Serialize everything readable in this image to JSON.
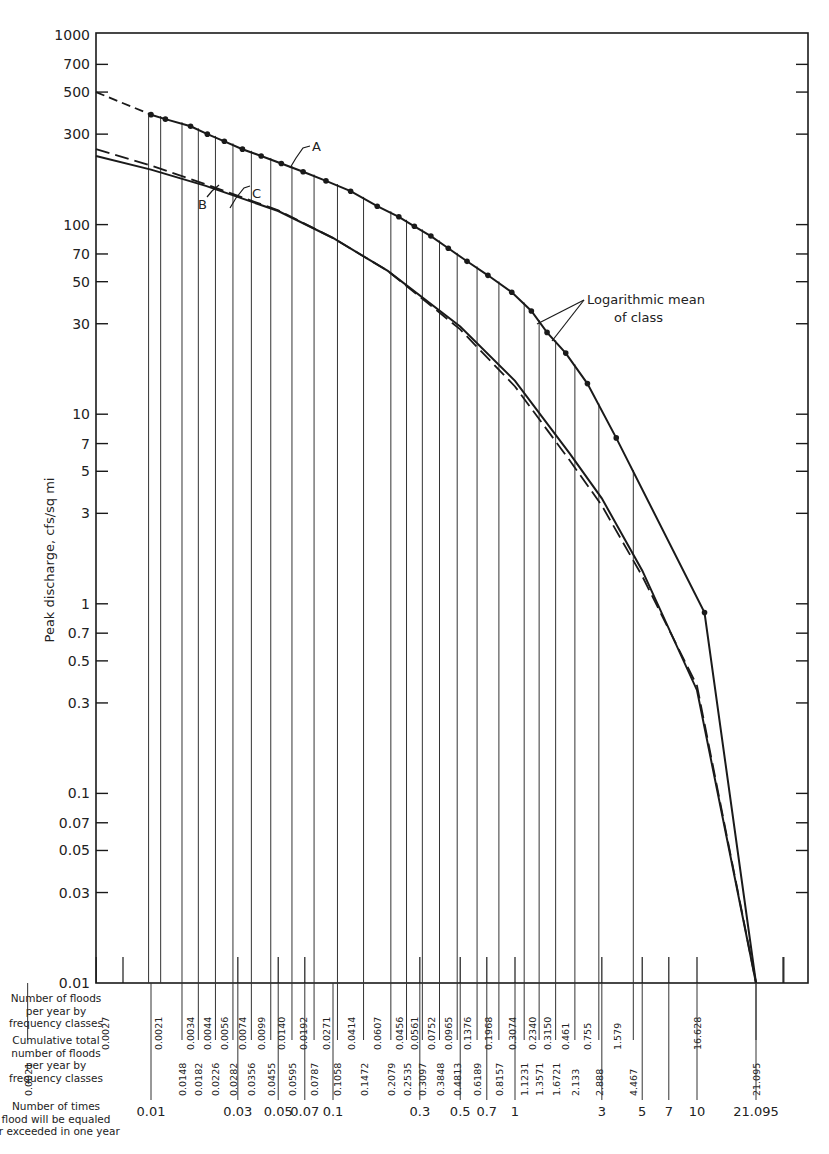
{
  "chart_data": {
    "type": "line",
    "title": "",
    "xlabel": "Number of times flood will be equaled or exceeded in one year",
    "ylabel": "Peak discharge, cfs/sq mi",
    "xscale": "log",
    "yscale": "log",
    "xlim": [
      0.01,
      40
    ],
    "ylim": [
      0.01,
      1000
    ],
    "grid": false,
    "y_ticks": [
      {
        "v": 1000,
        "label": "1000"
      },
      {
        "v": 700,
        "label": "700"
      },
      {
        "v": 500,
        "label": "500"
      },
      {
        "v": 300,
        "label": "300"
      },
      {
        "v": 100,
        "label": "100"
      },
      {
        "v": 70,
        "label": "70"
      },
      {
        "v": 50,
        "label": "50"
      },
      {
        "v": 30,
        "label": "30"
      },
      {
        "v": 10,
        "label": "10"
      },
      {
        "v": 7,
        "label": "7"
      },
      {
        "v": 5,
        "label": "5"
      },
      {
        "v": 3,
        "label": "3"
      },
      {
        "v": 1,
        "label": "1"
      },
      {
        "v": 0.7,
        "label": "0.7"
      },
      {
        "v": 0.5,
        "label": "0.5"
      },
      {
        "v": 0.3,
        "label": "0.3"
      },
      {
        "v": 0.1,
        "label": "0.1"
      },
      {
        "v": 0.07,
        "label": "0.07"
      },
      {
        "v": 0.05,
        "label": "0.05"
      },
      {
        "v": 0.03,
        "label": "0.03"
      },
      {
        "v": 0.01,
        "label": "0.01"
      }
    ],
    "x_ticks": [
      {
        "v": 0.01,
        "label": "0.01"
      },
      {
        "v": 0.03,
        "label": "0.03"
      },
      {
        "v": 0.05,
        "label": "0.05"
      },
      {
        "v": 0.07,
        "label": "0.07"
      },
      {
        "v": 0.1,
        "label": "0.1"
      },
      {
        "v": 0.3,
        "label": "0.3"
      },
      {
        "v": 0.5,
        "label": "0.5"
      },
      {
        "v": 0.7,
        "label": "0.7"
      },
      {
        "v": 1,
        "label": "1"
      },
      {
        "v": 3,
        "label": "3"
      },
      {
        "v": 5,
        "label": "5"
      },
      {
        "v": 7,
        "label": "7"
      },
      {
        "v": 10,
        "label": "10"
      },
      {
        "v": 21.095,
        "label": "21.095"
      }
    ],
    "bottom_axis_minor_ticks": [
      0.005,
      0.02,
      0.04,
      0.06,
      0.2,
      0.4,
      0.6,
      2,
      4,
      6,
      8,
      30
    ],
    "row_labels": {
      "floods_per_class": "Number of floods per year by frequency classes",
      "cumulative": "Cumulative total number of floods per year by frequency classes",
      "times_exceeded": "Number of times flood will be equaled or exceeded in one year"
    },
    "frequency_classes": [
      {
        "n": "0.0021",
        "cum": "0.0021"
      },
      {
        "n": "0.0027",
        "cum": "0.0148"
      },
      {
        "n": "0.0034",
        "cum": "0.0182"
      },
      {
        "n": "0.0044",
        "cum": "0.0226"
      },
      {
        "n": "0.0056",
        "cum": "0.0282"
      },
      {
        "n": "0.0074",
        "cum": "0.0356"
      },
      {
        "n": "0.0099",
        "cum": "0.0455"
      },
      {
        "n": "0.0140",
        "cum": "0.0595"
      },
      {
        "n": "0.0192",
        "cum": "0.0787"
      },
      {
        "n": "0.0271",
        "cum": "0.1058"
      },
      {
        "n": "0.0414",
        "cum": "0.1472"
      },
      {
        "n": "0.0607",
        "cum": "0.2079"
      },
      {
        "n": "0.0456",
        "cum": "0.2535"
      },
      {
        "n": "0.0561",
        "cum": "0.3097"
      },
      {
        "n": "0.0752",
        "cum": "0.3848"
      },
      {
        "n": "0.0965",
        "cum": "0.4813"
      },
      {
        "n": "0.1376",
        "cum": "0.6189"
      },
      {
        "n": "0.1968",
        "cum": "0.8157"
      },
      {
        "n": "0.3074",
        "cum": "1.1231"
      },
      {
        "n": "0.2340",
        "cum": "1.3571"
      },
      {
        "n": "0.3150",
        "cum": "1.6721"
      },
      {
        "n": "0.461",
        "cum": "2.133"
      },
      {
        "n": "0.755",
        "cum": "2.888"
      },
      {
        "n": "1.579",
        "cum": "4.467"
      },
      {
        "n": "16.628",
        "cum": "21.095"
      }
    ],
    "class_boundaries_x": [
      0.0021,
      0.0048,
      0.0148,
      0.0182,
      0.0226,
      0.0282,
      0.0356,
      0.0455,
      0.0595,
      0.0787,
      0.1058,
      0.1472,
      0.2079,
      0.2535,
      0.3097,
      0.3848,
      0.4813,
      0.6189,
      0.8157,
      1.1231,
      1.3571,
      1.6721,
      2.133,
      2.888,
      4.467,
      21.095
    ],
    "series": [
      {
        "name": "A",
        "style": "solid with points (dashed extrapolation to left axis)",
        "points": [
          {
            "x": 0.01,
            "y": 380
          },
          {
            "x": 0.012,
            "y": 360
          },
          {
            "x": 0.0165,
            "y": 330
          },
          {
            "x": 0.0204,
            "y": 300
          },
          {
            "x": 0.0253,
            "y": 275
          },
          {
            "x": 0.0318,
            "y": 250
          },
          {
            "x": 0.0403,
            "y": 230
          },
          {
            "x": 0.052,
            "y": 210
          },
          {
            "x": 0.0685,
            "y": 190
          },
          {
            "x": 0.0915,
            "y": 170
          },
          {
            "x": 0.125,
            "y": 150
          },
          {
            "x": 0.175,
            "y": 125
          },
          {
            "x": 0.23,
            "y": 110
          },
          {
            "x": 0.28,
            "y": 98
          },
          {
            "x": 0.345,
            "y": 87
          },
          {
            "x": 0.43,
            "y": 75
          },
          {
            "x": 0.545,
            "y": 64
          },
          {
            "x": 0.71,
            "y": 54
          },
          {
            "x": 0.96,
            "y": 44
          },
          {
            "x": 1.23,
            "y": 35
          },
          {
            "x": 1.5,
            "y": 27
          },
          {
            "x": 1.9,
            "y": 21
          },
          {
            "x": 2.5,
            "y": 14.5
          },
          {
            "x": 3.6,
            "y": 7.5
          },
          {
            "x": 11,
            "y": 0.9
          }
        ],
        "extrapolated_y_at_left_axis": 500,
        "ends_at": {
          "x": 21.095,
          "y": 0.01
        }
      },
      {
        "name": "B",
        "style": "solid",
        "points": [
          {
            "x": 0.005,
            "y": 230
          },
          {
            "x": 0.01,
            "y": 195
          },
          {
            "x": 0.02,
            "y": 160
          },
          {
            "x": 0.05,
            "y": 118
          },
          {
            "x": 0.1,
            "y": 85
          },
          {
            "x": 0.2,
            "y": 57
          },
          {
            "x": 0.5,
            "y": 29
          },
          {
            "x": 1,
            "y": 15
          },
          {
            "x": 2,
            "y": 6.2
          },
          {
            "x": 3,
            "y": 3.6
          },
          {
            "x": 5,
            "y": 1.5
          },
          {
            "x": 10,
            "y": 0.35
          },
          {
            "x": 21.095,
            "y": 0.01
          }
        ]
      },
      {
        "name": "C",
        "style": "dashed",
        "points": [
          {
            "x": 0.005,
            "y": 250
          },
          {
            "x": 0.01,
            "y": 205
          },
          {
            "x": 0.02,
            "y": 163
          },
          {
            "x": 0.05,
            "y": 119
          },
          {
            "x": 0.1,
            "y": 85
          },
          {
            "x": 0.2,
            "y": 57
          },
          {
            "x": 0.5,
            "y": 28
          },
          {
            "x": 1,
            "y": 14
          },
          {
            "x": 2,
            "y": 5.7
          },
          {
            "x": 3,
            "y": 3.3
          },
          {
            "x": 5,
            "y": 1.4
          },
          {
            "x": 10,
            "y": 0.37
          },
          {
            "x": 21.095,
            "y": 0.01
          }
        ]
      }
    ],
    "annotations": [
      {
        "text": "A",
        "target": "series A"
      },
      {
        "text": "B",
        "target": "series B"
      },
      {
        "text": "C",
        "target": "series C"
      },
      {
        "text": "Logarithmic mean of class",
        "target": "points on series A"
      }
    ]
  },
  "labels": {
    "y_axis_title": "Peak discharge, cfs/sq mi",
    "row1": [
      "Number of floods",
      "per year by",
      "frequency classes"
    ],
    "row2": [
      "Cumulative total",
      "number of floods",
      "per year by",
      "frequency classes"
    ],
    "row3": [
      "Number of times",
      "flood will be equaled",
      "or exceeded in one year"
    ],
    "annot_A": "A",
    "annot_B": "B",
    "annot_C": "C",
    "annot_logmean": [
      "Logarithmic mean",
      "of class"
    ]
  }
}
